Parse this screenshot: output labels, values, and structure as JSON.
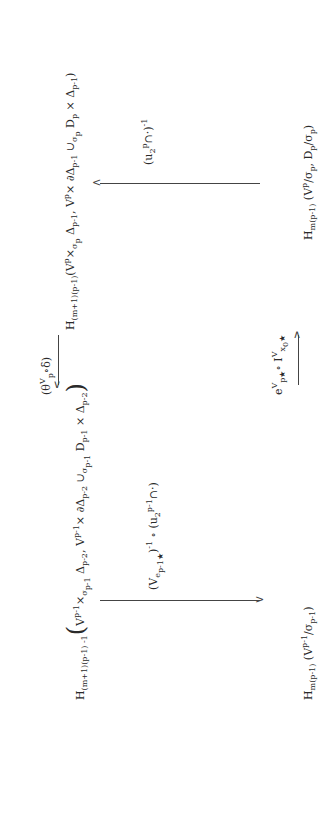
{
  "diagram": {
    "top_left": "H_(m+1)(p-1)-1 ( V^{p-1} ×_σ_{p-1} Δ_{p-2}, V^{p-1} × ∂Δ_{p-2} ∪_σ_{p-1} D_{p-1} × Δ_{p-2} )",
    "top_right": "H_(m+1)(p-1) ( V^p ×_σ_p Δ_{p-1}, V^p × ∂Δ_{p-1} ∪_σ_p D_p × Δ_{p-1} )",
    "bottom_left": "H_m(p-1) ( V^{p-1} / σ_{p-1} )",
    "bottom_right": "H_m(p-1) ( V^p / σ_p, D_p / σ_p )",
    "top_arrow_label": "(θ^V_p ∘ δ)",
    "bottom_arrow_label": "e^V_{p★} ∘ I^V_{x_0★}",
    "left_arrow_label": "(V_{e_{p-1★}})^{-1} ∘ (u_2^{p-1} ∩ ·)",
    "right_arrow_label": "(u_2^p ∩ ·)^{-1}"
  }
}
